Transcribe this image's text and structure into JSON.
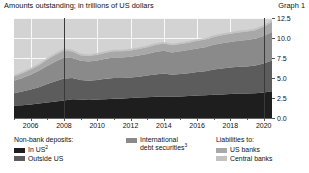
{
  "header": {
    "title": "Amounts outstanding; in trillions of US dollars",
    "graph_label": "Graph 1"
  },
  "legend": {
    "groups": [
      {
        "heading": "Non-bank deposits:",
        "items": [
          {
            "label": "In US",
            "sup": "2",
            "color": "#1e1e1e"
          },
          {
            "label": "Outside US",
            "sup": "",
            "color": "#5c5c5c"
          }
        ]
      },
      {
        "heading": "",
        "items": [
          {
            "label": "International debt securities",
            "sup": "3",
            "color": "#8a8a8a"
          }
        ]
      },
      {
        "heading": "Liabilities to:",
        "items": [
          {
            "label": "US banks",
            "sup": "",
            "color": "#a8a8a8"
          },
          {
            "label": "Central banks",
            "sup": "",
            "color": "#c2c2c2"
          }
        ]
      }
    ]
  },
  "chart_data": {
    "type": "area",
    "stacked": true,
    "title": "Amounts outstanding; in trillions of US dollars",
    "xlabel": "",
    "ylabel": "",
    "ylim": [
      0,
      12.5
    ],
    "yticks": [
      0.0,
      2.5,
      5.0,
      7.5,
      10.0,
      12.5
    ],
    "ytick_labels": [
      "0.0",
      "2.5",
      "5.0",
      "7.5",
      "10.0",
      "12.5"
    ],
    "y_axis_position": "right",
    "xlim": [
      2005.0,
      2020.5
    ],
    "xticks": [
      2006,
      2008,
      2010,
      2012,
      2014,
      2016,
      2018,
      2020
    ],
    "xtick_labels": [
      "2006",
      "2008",
      "2010",
      "2012",
      "2014",
      "2016",
      "2018",
      "2020"
    ],
    "grid": true,
    "legend_position": "below",
    "plot_background": "#d3d3d3",
    "vertical_markers": [
      2008,
      2020
    ],
    "x": [
      2005.0,
      2005.5,
      2006.0,
      2006.5,
      2007.0,
      2007.5,
      2008.0,
      2008.5,
      2009.0,
      2009.5,
      2010.0,
      2010.5,
      2011.0,
      2011.5,
      2012.0,
      2012.5,
      2013.0,
      2013.5,
      2014.0,
      2014.5,
      2015.0,
      2015.5,
      2016.0,
      2016.5,
      2017.0,
      2017.5,
      2018.0,
      2018.5,
      2019.0,
      2019.5,
      2020.0,
      2020.5
    ],
    "series": [
      {
        "name": "Non-bank deposits: In US",
        "color": "#1e1e1e",
        "values": [
          1.55,
          1.6,
          1.7,
          1.8,
          1.95,
          2.05,
          2.2,
          2.35,
          2.3,
          2.25,
          2.3,
          2.35,
          2.4,
          2.45,
          2.5,
          2.55,
          2.6,
          2.65,
          2.7,
          2.65,
          2.7,
          2.75,
          2.8,
          2.85,
          2.9,
          2.95,
          3.0,
          3.05,
          3.05,
          3.1,
          3.2,
          3.35
        ]
      },
      {
        "name": "Non-bank deposits: Outside US",
        "color": "#5c5c5c",
        "values": [
          1.55,
          1.7,
          1.85,
          2.05,
          2.3,
          2.55,
          2.75,
          2.65,
          2.45,
          2.4,
          2.45,
          2.55,
          2.6,
          2.55,
          2.55,
          2.6,
          2.7,
          2.8,
          2.85,
          2.75,
          2.8,
          2.85,
          2.95,
          3.0,
          3.15,
          3.25,
          3.3,
          3.35,
          3.4,
          3.45,
          3.6,
          3.85
        ]
      },
      {
        "name": "International debt securities",
        "color": "#8a8a8a",
        "values": [
          1.55,
          1.7,
          1.85,
          2.05,
          2.25,
          2.45,
          2.6,
          2.5,
          2.4,
          2.4,
          2.45,
          2.5,
          2.55,
          2.55,
          2.6,
          2.65,
          2.7,
          2.8,
          2.85,
          2.8,
          2.85,
          2.9,
          2.95,
          3.0,
          3.1,
          3.15,
          3.2,
          3.25,
          3.3,
          3.35,
          3.45,
          3.55
        ]
      },
      {
        "name": "Liabilities to: US banks",
        "color": "#a8a8a8",
        "values": [
          0.55,
          0.6,
          0.65,
          0.7,
          0.8,
          0.85,
          0.9,
          0.8,
          0.7,
          0.7,
          0.72,
          0.75,
          0.78,
          0.78,
          0.8,
          0.82,
          0.85,
          0.88,
          0.9,
          0.88,
          0.9,
          0.92,
          0.95,
          0.95,
          0.98,
          1.0,
          1.02,
          1.05,
          1.05,
          1.08,
          1.15,
          1.25
        ]
      },
      {
        "name": "Liabilities to: Central banks",
        "color": "#c2c2c2",
        "values": [
          0.18,
          0.18,
          0.2,
          0.2,
          0.22,
          0.22,
          0.25,
          0.22,
          0.2,
          0.2,
          0.2,
          0.2,
          0.2,
          0.2,
          0.2,
          0.2,
          0.2,
          0.2,
          0.2,
          0.2,
          0.2,
          0.2,
          0.2,
          0.2,
          0.2,
          0.2,
          0.2,
          0.2,
          0.2,
          0.2,
          0.22,
          0.25
        ]
      }
    ]
  }
}
